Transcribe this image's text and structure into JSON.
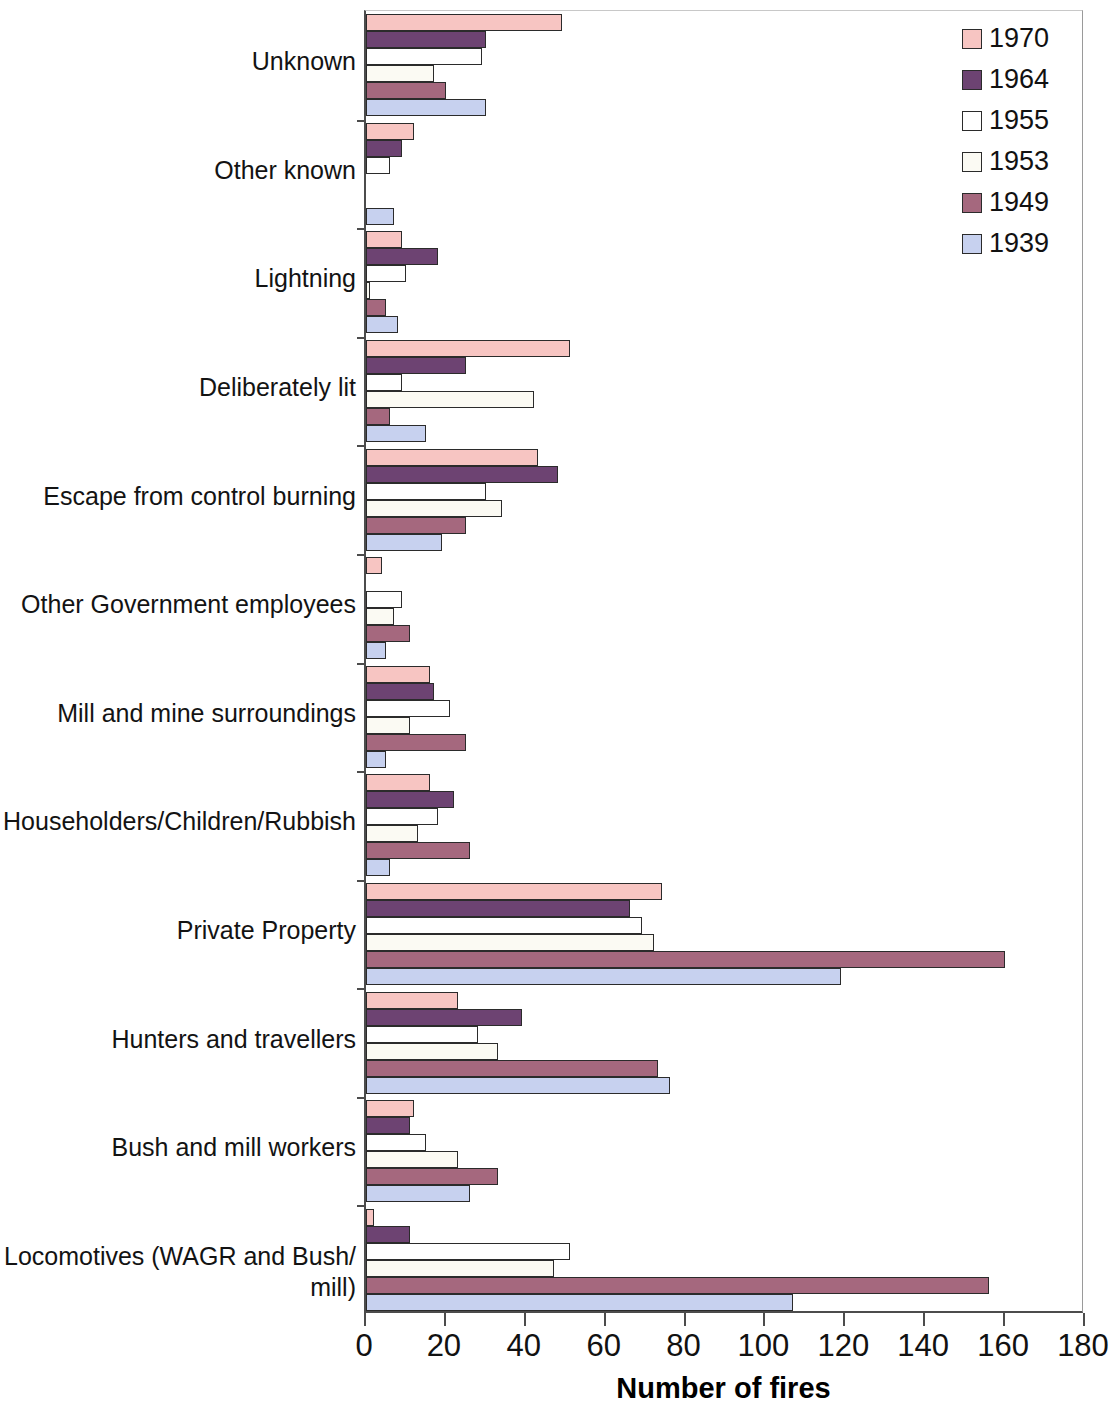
{
  "chart_data": {
    "type": "bar",
    "orientation": "horizontal",
    "title": "",
    "xlabel": "Number of fires",
    "ylabel": "",
    "xlim": [
      0,
      180
    ],
    "xticks": [
      0,
      20,
      40,
      60,
      80,
      100,
      120,
      140,
      160,
      180
    ],
    "grid": false,
    "legend_position": "top-right",
    "categories": [
      "Unknown",
      "Other known",
      "Lightning",
      "Deliberately lit",
      "Escape from control burning",
      "Other Government employees",
      "Mill and mine surroundings",
      "Householders/Children/Rubbish",
      "Private Property",
      "Hunters and travellers",
      "Bush and mill workers",
      "Locomotives (WAGR and Bush/\nmill)"
    ],
    "series": [
      {
        "name": "1970",
        "color": "#f7c5c2",
        "values": [
          49,
          12,
          9,
          51,
          43,
          4,
          16,
          16,
          74,
          23,
          12,
          2
        ]
      },
      {
        "name": "1964",
        "color": "#6d4372",
        "values": [
          30,
          9,
          18,
          25,
          48,
          0,
          17,
          22,
          66,
          39,
          11,
          11
        ]
      },
      {
        "name": "1955",
        "color": "#ffffff",
        "values": [
          29,
          6,
          10,
          9,
          30,
          9,
          21,
          18,
          69,
          28,
          15,
          51
        ]
      },
      {
        "name": "1953",
        "color": "#fbfaf3",
        "values": [
          17,
          0,
          1,
          42,
          34,
          7,
          11,
          13,
          72,
          33,
          23,
          47
        ]
      },
      {
        "name": "1949",
        "color": "#a5687e",
        "values": [
          20,
          0,
          5,
          6,
          25,
          11,
          25,
          26,
          160,
          73,
          33,
          156
        ]
      },
      {
        "name": "1939",
        "color": "#c7d1ef",
        "values": [
          30,
          7,
          8,
          15,
          19,
          5,
          5,
          6,
          119,
          76,
          26,
          107
        ]
      }
    ]
  },
  "legend": {
    "items": [
      {
        "label": "1970",
        "color": "#f7c5c2"
      },
      {
        "label": "1964",
        "color": "#6d4372"
      },
      {
        "label": "1955",
        "color": "#ffffff"
      },
      {
        "label": "1953",
        "color": "#fbfaf3"
      },
      {
        "label": "1949",
        "color": "#a5687e"
      },
      {
        "label": "1939",
        "color": "#c7d1ef"
      }
    ]
  },
  "axis": {
    "x_title": "Number of fires",
    "tick_labels": [
      "0",
      "20",
      "40",
      "60",
      "80",
      "100",
      "120",
      "140",
      "160",
      "180"
    ]
  }
}
